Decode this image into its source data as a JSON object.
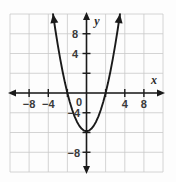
{
  "chart_data": {
    "type": "line",
    "title": "",
    "subtitle": "",
    "xlabel": "x",
    "ylabel": "y",
    "xlim": [
      -10,
      10
    ],
    "ylim": [
      -10,
      10
    ],
    "grid": true,
    "grid_step": 2,
    "legend": "none",
    "equation": "y = x^2 - 4",
    "vertex": [
      0,
      -4
    ],
    "roots": [
      -2,
      2
    ],
    "x_tick_labels": [
      "-8",
      "-4",
      "0",
      "4",
      "8"
    ],
    "x_tick_values": [
      -8,
      -4,
      0,
      4,
      8
    ],
    "y_tick_labels": [
      "8",
      "4",
      "-4",
      "-8"
    ],
    "y_tick_values": [
      8,
      4,
      -4,
      -8
    ],
    "origin_label": "0",
    "series": [
      {
        "name": "parabola",
        "color": "#1a1a1a",
        "x": [
          -3.5,
          -3.25,
          -3,
          -2.75,
          -2.5,
          -2.25,
          -2,
          -1.75,
          -1.5,
          -1.25,
          -1,
          -0.75,
          -0.5,
          -0.25,
          0,
          0.25,
          0.5,
          0.75,
          1,
          1.25,
          1.5,
          1.75,
          2,
          2.25,
          2.5,
          2.75,
          3,
          3.25,
          3.5
        ],
        "values": [
          8.25,
          6.5625,
          5,
          3.5625,
          2.25,
          1.0625,
          0,
          -0.9375,
          -1.75,
          -2.4375,
          -3,
          -3.4375,
          -3.75,
          -3.9375,
          -4,
          -3.9375,
          -3.75,
          -3.4375,
          -3,
          -2.4375,
          -1.75,
          -0.9375,
          0,
          1.0625,
          2.25,
          3.5625,
          5,
          6.5625,
          8.25
        ]
      }
    ]
  },
  "axes": {
    "x_axis_name": "x",
    "y_axis_name": "y"
  }
}
